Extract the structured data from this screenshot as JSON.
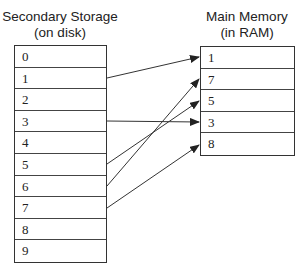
{
  "left": {
    "title_line1": "Secondary Storage",
    "title_line2": "(on disk)",
    "cells": [
      "0",
      "1",
      "2",
      "3",
      "4",
      "5",
      "6",
      "7",
      "8",
      "9"
    ]
  },
  "right": {
    "title_line1": "Main Memory",
    "title_line2": "(in RAM)",
    "cells": [
      "1",
      "7",
      "5",
      "3",
      "8"
    ]
  },
  "arrows": [
    {
      "from": "1",
      "to": "1",
      "x1": 107,
      "y1": 78,
      "x2": 199,
      "y2": 57
    },
    {
      "from": "3",
      "to": "3",
      "x1": 107,
      "y1": 121,
      "x2": 199,
      "y2": 122
    },
    {
      "from": "5",
      "to": "5",
      "x1": 107,
      "y1": 164,
      "x2": 199,
      "y2": 101
    },
    {
      "from": "7",
      "to": "7",
      "x1": 107,
      "y1": 186,
      "x2": 199,
      "y2": 79
    },
    {
      "from": "8",
      "to": "8",
      "x1": 107,
      "y1": 208,
      "x2": 199,
      "y2": 145
    }
  ],
  "colors": {
    "line": "#333333",
    "text": "#222222"
  }
}
